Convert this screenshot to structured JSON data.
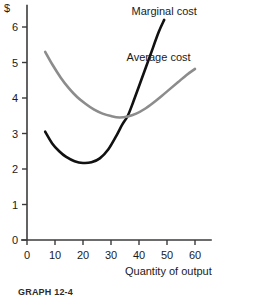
{
  "chart_data": {
    "type": "line",
    "title": "",
    "xlabel": "Quantity of output",
    "ylabel": "$",
    "xlim": [
      0,
      66
    ],
    "ylim": [
      0,
      6.4
    ],
    "grid": false,
    "legend_position": "inline-annotation",
    "x_ticks": [
      0,
      10,
      20,
      30,
      40,
      50,
      60
    ],
    "x_tick_labels": [
      "0",
      "10",
      "20",
      "30",
      "40",
      "50",
      "60"
    ],
    "y_ticks": [
      0,
      1,
      2,
      3,
      4,
      5,
      6
    ],
    "y_tick_labels": [
      "0",
      "1",
      "2",
      "3",
      "4",
      "5",
      "6"
    ],
    "series": [
      {
        "name": "Marginal cost",
        "color": "#111111",
        "label_x": 49,
        "label_y": 6.35,
        "points": [
          {
            "x": 6.5,
            "y": 3.05
          },
          {
            "x": 9.0,
            "y": 2.72
          },
          {
            "x": 11.5,
            "y": 2.5
          },
          {
            "x": 14.0,
            "y": 2.34
          },
          {
            "x": 17.0,
            "y": 2.22
          },
          {
            "x": 20.0,
            "y": 2.17
          },
          {
            "x": 23.0,
            "y": 2.19
          },
          {
            "x": 26.0,
            "y": 2.3
          },
          {
            "x": 29.0,
            "y": 2.55
          },
          {
            "x": 32.0,
            "y": 2.95
          },
          {
            "x": 34.0,
            "y": 3.25
          },
          {
            "x": 36.0,
            "y": 3.5
          },
          {
            "x": 38.0,
            "y": 3.9
          },
          {
            "x": 41.0,
            "y": 4.55
          },
          {
            "x": 44.0,
            "y": 5.2
          },
          {
            "x": 47.0,
            "y": 5.85
          },
          {
            "x": 49.0,
            "y": 6.2
          }
        ]
      },
      {
        "name": "Average cost",
        "color": "#8c8c8c",
        "label_x": 47,
        "label_y": 5.05,
        "points": [
          {
            "x": 6.5,
            "y": 5.3
          },
          {
            "x": 9.0,
            "y": 4.95
          },
          {
            "x": 12.0,
            "y": 4.58
          },
          {
            "x": 15.0,
            "y": 4.27
          },
          {
            "x": 18.0,
            "y": 4.02
          },
          {
            "x": 21.0,
            "y": 3.83
          },
          {
            "x": 24.0,
            "y": 3.67
          },
          {
            "x": 27.0,
            "y": 3.56
          },
          {
            "x": 30.0,
            "y": 3.49
          },
          {
            "x": 33.0,
            "y": 3.45
          },
          {
            "x": 36.0,
            "y": 3.48
          },
          {
            "x": 39.0,
            "y": 3.56
          },
          {
            "x": 42.0,
            "y": 3.69
          },
          {
            "x": 45.0,
            "y": 3.86
          },
          {
            "x": 48.0,
            "y": 4.05
          },
          {
            "x": 51.0,
            "y": 4.25
          },
          {
            "x": 54.0,
            "y": 4.45
          },
          {
            "x": 57.0,
            "y": 4.65
          },
          {
            "x": 60.0,
            "y": 4.82
          }
        ]
      }
    ],
    "annotations": [
      {
        "text": "Marginal cost"
      },
      {
        "text": "Average cost"
      }
    ]
  },
  "figure": {
    "y_axis_symbol": "$",
    "x_axis_title": "Quantity of output",
    "caption": "GRAPH 12-4"
  }
}
